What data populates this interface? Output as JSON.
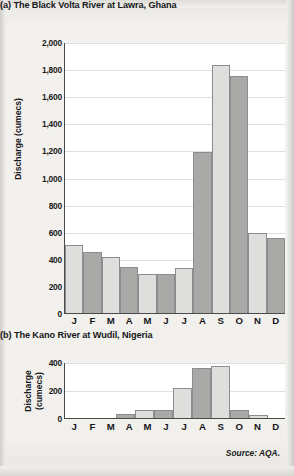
{
  "page": {
    "source_note": "Source: AQA."
  },
  "figures": [
    {
      "label": "(a)",
      "title": "(a) The Black Volta River at Lawra, Ghana",
      "y_axis_title": "Discharge (cumecs)",
      "y_axis_title_lines": [
        "Discharge (cumecs)"
      ]
    },
    {
      "label": "(b)",
      "title": "(b) The Kano River at Wudil, Nigeria",
      "y_axis_title": "Discharge (cumecs)",
      "y_axis_title_lines": [
        "Discharge",
        "(cumecs)"
      ]
    }
  ],
  "chart_data": [
    {
      "type": "bar",
      "title": "(a) The Black Volta River at Lawra, Ghana",
      "xlabel": "",
      "ylabel": "Discharge (cumecs)",
      "ylim": [
        0,
        2000
      ],
      "ytick_step": 200,
      "ytick_labels": [
        "2,000",
        "1,800",
        "1,600",
        "1,400",
        "1,200",
        "1,000",
        "800",
        "600",
        "400",
        "200",
        "0"
      ],
      "ytick_values": [
        2000,
        1800,
        1600,
        1400,
        1200,
        1000,
        800,
        600,
        400,
        200,
        0
      ],
      "grid": true,
      "legend": "none",
      "categories": [
        "J",
        "F",
        "M",
        "A",
        "M",
        "J",
        "J",
        "A",
        "S",
        "O",
        "N",
        "D"
      ],
      "values": [
        500,
        450,
        410,
        340,
        290,
        290,
        330,
        1190,
        1830,
        1750,
        590,
        550
      ],
      "bar_shades": [
        "light",
        "dark",
        "light",
        "dark",
        "light",
        "dark",
        "light",
        "dark",
        "light",
        "dark",
        "light",
        "dark"
      ],
      "colors": {
        "light": "#dededc",
        "dark": "#a9a9a7",
        "border": "#8d8d8d",
        "axis": "#4a4a4a",
        "grid": "#dfdfdf"
      }
    },
    {
      "type": "bar",
      "title": "(b) The Kano River at Wudil, Nigeria",
      "xlabel": "",
      "ylabel": "Discharge (cumecs)",
      "ylim": [
        0,
        400
      ],
      "ytick_step": 200,
      "ytick_labels": [
        "400",
        "200",
        "0"
      ],
      "ytick_values": [
        400,
        200,
        0
      ],
      "grid": true,
      "legend": "none",
      "categories": [
        "J",
        "F",
        "M",
        "A",
        "M",
        "J",
        "J",
        "A",
        "S",
        "O",
        "N",
        "D"
      ],
      "values": [
        0,
        0,
        0,
        30,
        55,
        60,
        215,
        355,
        370,
        55,
        20,
        0
      ],
      "bar_shades": [
        "light",
        "dark",
        "light",
        "dark",
        "light",
        "dark",
        "light",
        "dark",
        "light",
        "dark",
        "light",
        "dark"
      ],
      "colors": {
        "light": "#dededc",
        "dark": "#a9a9a7",
        "border": "#8d8d8d",
        "axis": "#4a4a4a",
        "grid": "#dfdfdf"
      }
    }
  ]
}
